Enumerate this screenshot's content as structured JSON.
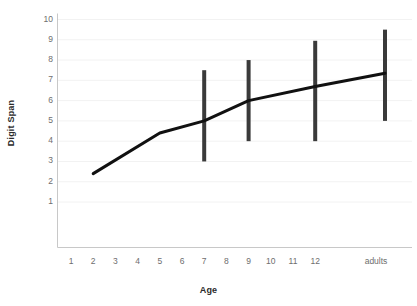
{
  "chart_data": {
    "type": "line",
    "title": "",
    "xlabel": "Age",
    "ylabel": "Digit Span",
    "x_tick_labels": [
      "1",
      "2",
      "3",
      "4",
      "5",
      "6",
      "7",
      "8",
      "9",
      "10",
      "11",
      "12",
      "adults"
    ],
    "y_tick_labels": [
      "10",
      "9",
      "8",
      "7",
      "6",
      "5",
      "4",
      "3",
      "2",
      "1"
    ],
    "ylim": [
      0,
      10
    ],
    "xlim_categories": [
      "1",
      "2",
      "3",
      "4",
      "5",
      "6",
      "7",
      "8",
      "9",
      "10",
      "11",
      "12",
      "adults"
    ],
    "grid": "horizontal-faint",
    "legend": "none",
    "series": [
      {
        "name": "Digit Span",
        "x": [
          "2",
          "5",
          "7",
          "9",
          "12",
          "adults"
        ],
        "values": [
          2.4,
          4.4,
          5.0,
          6.0,
          6.7,
          7.35
        ],
        "color": "#111111",
        "line_width": 3
      }
    ],
    "error_bars": [
      {
        "x": "7",
        "low": 3.0,
        "high": 7.5,
        "color": "#3a3a3a"
      },
      {
        "x": "9",
        "low": 4.0,
        "high": 8.0,
        "color": "#3a3a3a"
      },
      {
        "x": "12",
        "low": 4.0,
        "high": 8.95,
        "color": "#3a3a3a"
      },
      {
        "x": "adults",
        "low": 5.0,
        "high": 9.5,
        "color": "#3a3a3a"
      }
    ],
    "colors": {
      "line": "#111111",
      "error_bar": "#3a3a3a",
      "axis": "#c8c8c8",
      "gridline": "#f2f2f2",
      "tick_text": "#6e6e6e",
      "axis_title": "#2b2b2b",
      "background": "#ffffff"
    }
  }
}
